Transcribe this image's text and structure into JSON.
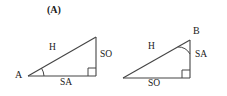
{
  "figure": {
    "background_color": "#ffffff",
    "stroke_color": "#404040",
    "text_color": "#1a1a1a",
    "width": 227,
    "height": 96
  },
  "panels": [
    {
      "id": "A",
      "caption": "(A)",
      "triangle": {
        "type": "right-triangle",
        "orientation": "right-angle-bottom-right",
        "vertices": {
          "acute_left": {
            "x": 28,
            "y": 76,
            "label": "A"
          },
          "right_angle": {
            "x": 96,
            "y": 76,
            "label": ""
          },
          "top": {
            "x": 96,
            "y": 37,
            "label": ""
          }
        },
        "marked_angle_at": "A",
        "side_labels": {
          "hypotenuse": "H",
          "adjacent": "SA",
          "opposite": "SO"
        }
      }
    },
    {
      "id": "B",
      "caption": "(B)",
      "triangle": {
        "type": "right-triangle",
        "orientation": "right-angle-bottom-right",
        "vertices": {
          "acute_left": {
            "x": 123,
            "y": 78,
            "label": ""
          },
          "right_angle": {
            "x": 190,
            "y": 78,
            "label": ""
          },
          "top": {
            "x": 190,
            "y": 40,
            "label": "B"
          }
        },
        "marked_angle_at": "B",
        "side_labels": {
          "hypotenuse": "H",
          "adjacent": "SA",
          "opposite": "SO"
        }
      }
    }
  ]
}
